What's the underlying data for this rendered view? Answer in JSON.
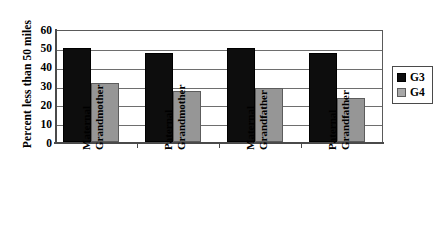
{
  "chart_data": {
    "type": "bar",
    "title": "",
    "xlabel": "",
    "ylabel": "Percent less than 50 miles",
    "ylim": [
      0,
      60
    ],
    "ytick_labels": [
      "60",
      "50",
      "40",
      "30",
      "20",
      "10",
      "0"
    ],
    "ytick_values": [
      60,
      50,
      40,
      30,
      20,
      10,
      0
    ],
    "grid": true,
    "legend_position": "right",
    "categories": [
      "Maternal Grandmother",
      "Paternal Grandmother",
      "Maternal Grandfather",
      "Paternal Grandfather"
    ],
    "category_lines": [
      [
        "Maternal",
        "Grandmother"
      ],
      [
        "Paternal",
        "Grandmother"
      ],
      [
        "Maternal",
        "Grandfather"
      ],
      [
        "Paternal",
        "Grandfather"
      ]
    ],
    "series": [
      {
        "name": "G3",
        "color": "#0d0d0d",
        "values": [
          50,
          47,
          50,
          47.5
        ]
      },
      {
        "name": "G4",
        "color": "#969696",
        "values": [
          31.5,
          27,
          28.5,
          23.5
        ]
      }
    ]
  },
  "legend": {
    "entries": [
      {
        "label": "G3"
      },
      {
        "label": "G4"
      }
    ]
  },
  "colors": {
    "series_g3": "#0d0d0d",
    "series_g4": "#969696",
    "axis": "#4a4a4a",
    "grid": "#6e6e6e",
    "background": "#ffffff"
  }
}
